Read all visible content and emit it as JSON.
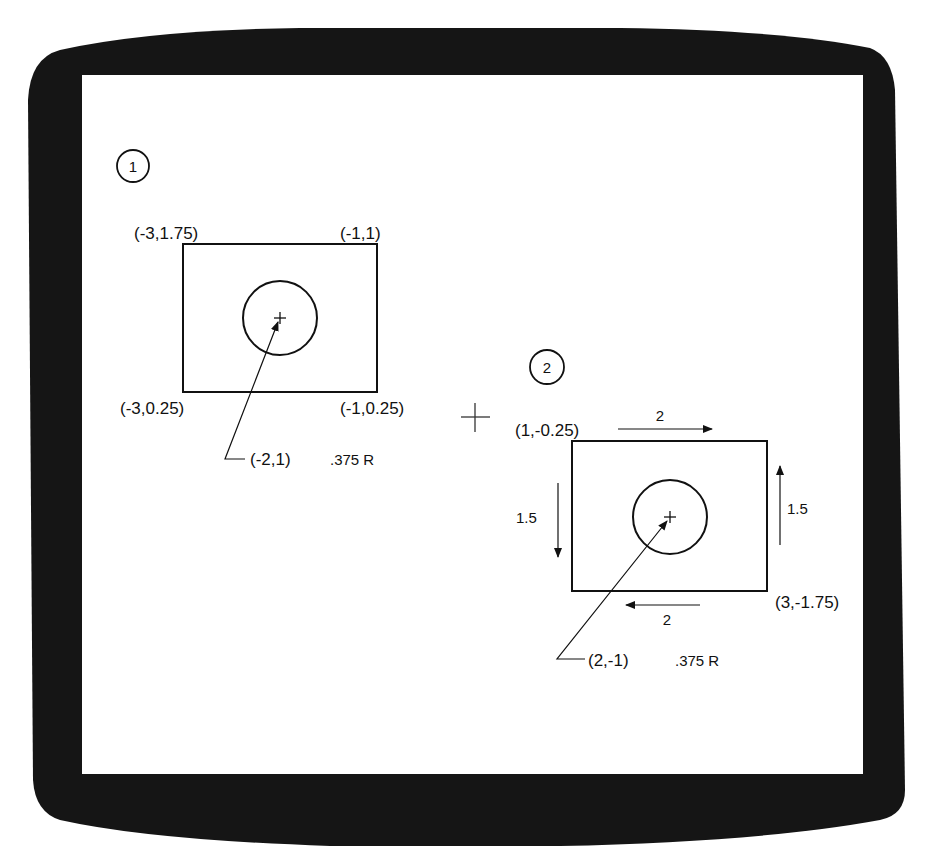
{
  "figure1": {
    "number": "1",
    "corners": {
      "top_left": "(-3,1.75)",
      "top_right": "(-1,1)",
      "bottom_left": "(-3,0.25)",
      "bottom_right": "(-1,0.25)"
    },
    "circle_center": "(-2,1)",
    "circle_radius": ".375 R"
  },
  "operator": "+",
  "figure2": {
    "number": "2",
    "corners": {
      "top_left": "(1,-0.25)",
      "bottom_right": "(3,-1.75)"
    },
    "circle_center": "(2,-1)",
    "circle_radius": ".375 R",
    "dimensions": {
      "top_width": "2",
      "bottom_width": "2",
      "left_height": "1.5",
      "right_height": "1.5"
    }
  },
  "colors": {
    "bezel": "#151515",
    "screen": "#ffffff",
    "ink": "#111111"
  }
}
